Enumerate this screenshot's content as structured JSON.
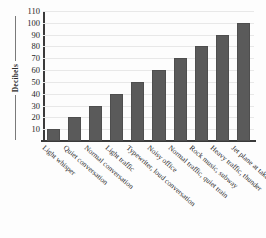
{
  "chart_data": {
    "type": "bar",
    "title": "",
    "xlabel": "",
    "ylabel": "Decibels",
    "ylim": [
      0,
      110
    ],
    "grid": true,
    "legend": false,
    "y_ticks": [
      10,
      20,
      30,
      40,
      50,
      60,
      70,
      80,
      90,
      100,
      110
    ],
    "categories": [
      "Light whisper",
      "Quiet conversation",
      "Normal conversation",
      "Light traffic",
      "Typewriter, loud conversation",
      "Noisy office",
      "Normal traffic, quiet train",
      "Rock music, subway",
      "Heavy traffic, thunder",
      "Jet plane at takeoff"
    ],
    "values": [
      10,
      20,
      30,
      40,
      50,
      60,
      70,
      80,
      90,
      100
    ],
    "bar_color": "#5a5a5a",
    "gridline_color": "#e8e8e8",
    "axis_color": "#3a3a3a",
    "background_color": "#fdfdfd"
  }
}
